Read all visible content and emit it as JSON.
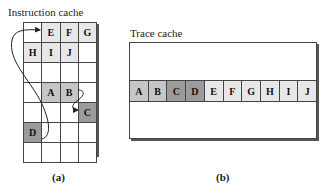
{
  "figure": {
    "instruction_cache": {
      "title": "Instruction cache",
      "label": "(a)",
      "rows": [
        [
          "",
          "E",
          "F",
          "G"
        ],
        [
          "H",
          "I",
          "J",
          ""
        ],
        [
          "",
          "",
          "",
          ""
        ],
        [
          "",
          "A",
          "B",
          ""
        ],
        [
          "",
          "",
          "",
          "C"
        ],
        [
          "D",
          "",
          "",
          ""
        ],
        [
          "",
          "",
          "",
          ""
        ]
      ],
      "flow": [
        "A→B",
        "B→C",
        "D→E"
      ]
    },
    "trace_cache": {
      "title": "Trace cache",
      "label": "(b)",
      "cells": [
        "A",
        "B",
        "C",
        "D",
        "E",
        "F",
        "G",
        "H",
        "I",
        "J"
      ]
    },
    "colors": {
      "ab_shade": "#c6c6c6",
      "cd_shade": "#9b9b9b",
      "ej_shade": "#e7e7e7",
      "line": "#444444"
    }
  }
}
